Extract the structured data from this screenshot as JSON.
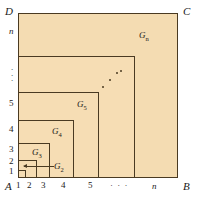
{
  "figure": {
    "type": "nested-squares-diagram",
    "background_color": "#ffffff",
    "fill_color": "#f6ddb4",
    "stroke_color": "#4a3a22"
  },
  "corners": {
    "top_left": "D",
    "top_right": "C",
    "bottom_left": "A",
    "bottom_right": "B"
  },
  "x_axis": {
    "ticks": [
      "1",
      "2",
      "3",
      "4",
      "5"
    ],
    "ellipsis": "· · ·",
    "last_tick": "n"
  },
  "y_axis": {
    "ticks": [
      "1",
      "2",
      "3",
      "4",
      "5"
    ],
    "ellipsis": "⋮",
    "last_tick": "n"
  },
  "regions": [
    {
      "id": "G1",
      "label_base": "G",
      "label_sub": "1",
      "show_label": false
    },
    {
      "id": "G2",
      "label_base": "G",
      "label_sub": "2",
      "show_label": true
    },
    {
      "id": "G3",
      "label_base": "G",
      "label_sub": "3",
      "show_label": true
    },
    {
      "id": "G4",
      "label_base": "G",
      "label_sub": "4",
      "show_label": true
    },
    {
      "id": "G5",
      "label_base": "G",
      "label_sub": "5",
      "show_label": true
    },
    {
      "id": "Gn",
      "label_base": "G",
      "label_sub": "n",
      "show_label": true
    }
  ],
  "labels": {
    "g2": "G",
    "g2_sub": "2",
    "g3": "G",
    "g3_sub": "3",
    "g4": "G",
    "g4_sub": "4",
    "g5": "G",
    "g5_sub": "5",
    "gn": "G",
    "gn_sub": "n"
  },
  "annotations": {
    "g2_arrow": "arrow-pointing-left-to-G2-band",
    "interior_diagonal_dots": "⋰"
  }
}
